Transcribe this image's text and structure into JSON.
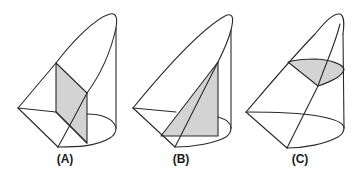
{
  "figure": {
    "colors": {
      "stroke": "#2a2a2a",
      "shade": "#d3d3d3",
      "background": "#ffffff"
    },
    "panels": [
      {
        "id": "A",
        "label": "(A)",
        "cross_section": "rectangle (perpendicular to base diameter)"
      },
      {
        "id": "B",
        "label": "(B)",
        "cross_section": "triangle (perpendicular to base diameter)"
      },
      {
        "id": "C",
        "label": "(C)",
        "cross_section": "semicircle-like region (parallel to base)"
      }
    ]
  }
}
